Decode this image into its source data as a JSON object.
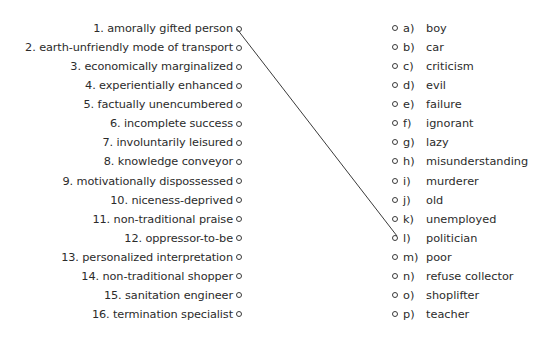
{
  "left_items": [
    {
      "label": "1. amorally gifted person"
    },
    {
      "label": "2. earth-unfriendly mode of transport"
    },
    {
      "label": "3. economically marginalized"
    },
    {
      "label": "4. experientially enhanced"
    },
    {
      "label": "5. factually unencumbered"
    },
    {
      "label": "6. incomplete success"
    },
    {
      "label": "7. involuntarily leisured"
    },
    {
      "label": "8. knowledge conveyor"
    },
    {
      "label": "9. motivationally dispossessed"
    },
    {
      "label": "10. niceness-deprived"
    },
    {
      "label": "11. non-traditional praise"
    },
    {
      "label": "12. oppressor-to-be"
    },
    {
      "label": "13. personalized interpretation"
    },
    {
      "label": "14. non-traditional shopper"
    },
    {
      "label": "15. sanitation engineer"
    },
    {
      "label": "16. termination specialist"
    }
  ],
  "right_items": [
    {
      "letter": "a)",
      "label": "boy"
    },
    {
      "letter": "b)",
      "label": "car"
    },
    {
      "letter": "c)",
      "label": "criticism"
    },
    {
      "letter": "d)",
      "label": "evil"
    },
    {
      "letter": "e)",
      "label": "failure"
    },
    {
      "letter": "f)",
      "label": "ignorant"
    },
    {
      "letter": "g)",
      "label": "lazy"
    },
    {
      "letter": "h)",
      "label": "misunderstanding"
    },
    {
      "letter": "i)",
      "label": "murderer"
    },
    {
      "letter": "j)",
      "label": "old"
    },
    {
      "letter": "k)",
      "label": "unemployed"
    },
    {
      "letter": "l)",
      "label": "politician"
    },
    {
      "letter": "m)",
      "label": "poor"
    },
    {
      "letter": "n)",
      "label": "refuse collector"
    },
    {
      "letter": "o)",
      "label": "shoplifter"
    },
    {
      "letter": "p)",
      "label": "teacher"
    }
  ],
  "connections": [
    {
      "from": "1",
      "to": "l"
    }
  ],
  "colors": {
    "text": "#2b2b2b",
    "line": "#3a3a3a"
  }
}
